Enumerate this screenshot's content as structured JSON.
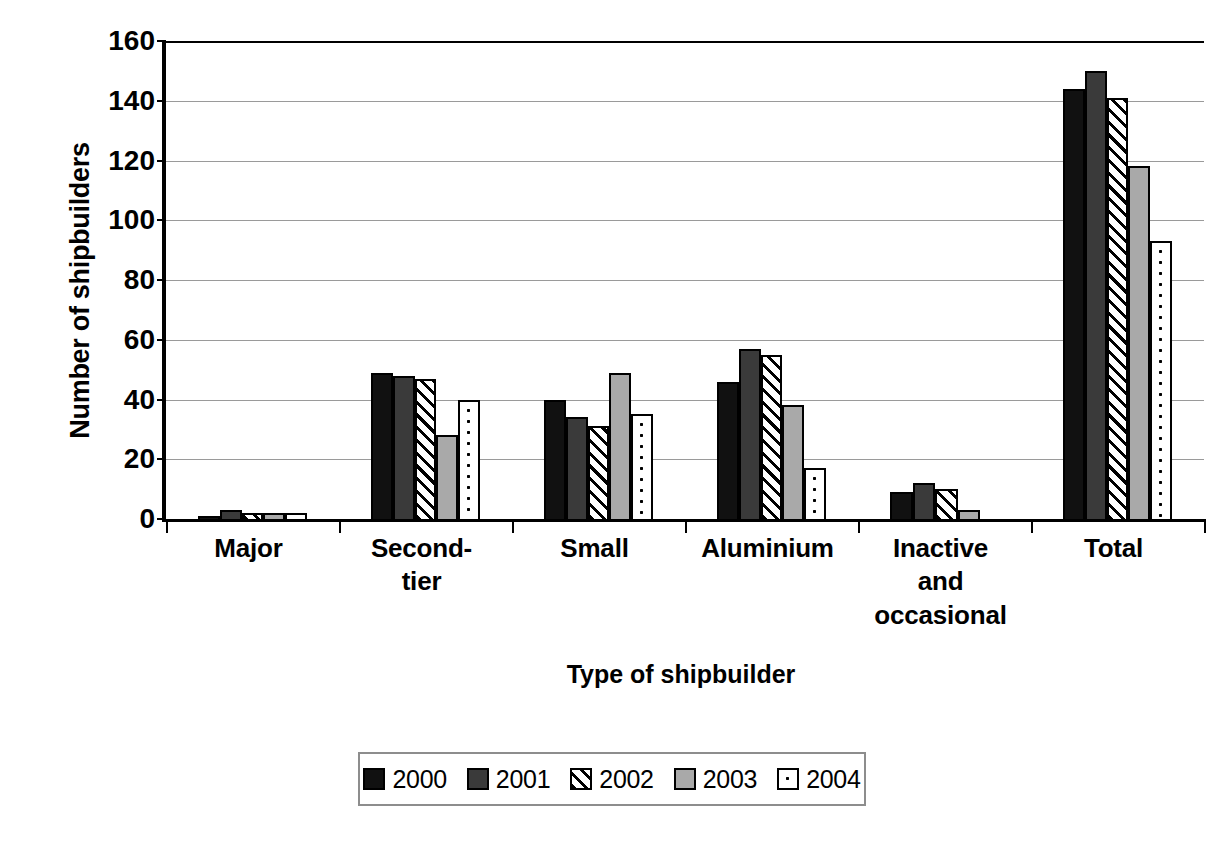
{
  "chart_data": {
    "type": "bar",
    "title": "",
    "xlabel": "Type of shipbuilder",
    "ylabel": "Number of shipbuilders",
    "ylim": [
      0,
      160
    ],
    "yticks": [
      0,
      20,
      40,
      60,
      80,
      100,
      120,
      140,
      160
    ],
    "grid": true,
    "legend_position": "bottom",
    "categories": [
      "Major",
      "Second-tier",
      "Small",
      "Aluminium",
      "Inactive and occasional",
      "Total"
    ],
    "category_labels": [
      [
        "Major"
      ],
      [
        "Second-",
        "tier"
      ],
      [
        "Small"
      ],
      [
        "Aluminium"
      ],
      [
        "Inactive",
        "and",
        "occasional"
      ],
      [
        "Total"
      ]
    ],
    "series": [
      {
        "name": "2000",
        "color": "#111111",
        "pattern": "solid-black",
        "values": [
          1,
          49,
          40,
          46,
          9,
          144
        ]
      },
      {
        "name": "2001",
        "color": "#3a3a3a",
        "pattern": "solid-dark-gray",
        "values": [
          3,
          48,
          34,
          57,
          12,
          150
        ]
      },
      {
        "name": "2002",
        "color": "#ffffff",
        "pattern": "diagonal-hatch",
        "values": [
          2,
          47,
          31,
          55,
          10,
          141
        ]
      },
      {
        "name": "2003",
        "color": "#a9a9a9",
        "pattern": "solid-gray",
        "values": [
          2,
          28,
          49,
          38,
          3,
          118
        ]
      },
      {
        "name": "2004",
        "color": "#ffffff",
        "pattern": "dotted",
        "values": [
          2,
          40,
          35,
          17,
          0,
          93
        ]
      }
    ]
  }
}
